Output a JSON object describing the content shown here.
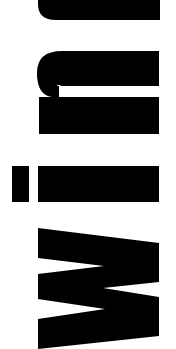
{
  "image": {
    "text": "wind",
    "orientation": "rotated 90deg counter-clockwise, reads bottom-to-top",
    "text_color": "#000000",
    "background_color": "#ffffff",
    "letters": [
      "w",
      "i",
      "n",
      "d"
    ]
  }
}
